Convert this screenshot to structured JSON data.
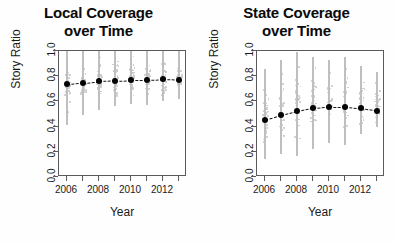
{
  "figure": {
    "panel_count": 2,
    "background": "#ffffff"
  },
  "panels": [
    {
      "id": "local",
      "title_line1": "Local Coverage",
      "title_line2": "over Time",
      "xlabel": "Year",
      "ylabel": "Story Ratio"
    },
    {
      "id": "state",
      "title_line1": "State Coverage",
      "title_line2": "over Time",
      "xlabel": "Year",
      "ylabel": "Story Ratio"
    }
  ],
  "axis": {
    "y_ticks": [
      "0.0",
      "0.2",
      "0.4",
      "0.6",
      "0.8",
      "1.0"
    ],
    "y_tick_values": [
      0.0,
      0.2,
      0.4,
      0.6,
      0.8,
      1.0
    ],
    "x_tick_values": [
      2006,
      2007,
      2008,
      2009,
      2010,
      2011,
      2012,
      2013
    ],
    "x_tick_labels": [
      "2006",
      "",
      "2008",
      "",
      "2010",
      "",
      "2012",
      ""
    ],
    "x_labeled": [
      "2006",
      "2008",
      "2010",
      "2012"
    ]
  },
  "colors": {
    "mean_point": "#050505",
    "trend_line": "#151515",
    "error_bar": "#bfbfbf",
    "scatter": "#c9c9c9",
    "axis": "#5a5a5a",
    "text": "#1a1a1a"
  },
  "chart_data": [
    {
      "type": "scatter",
      "id": "local",
      "title": "Local Coverage over Time",
      "xlabel": "Year",
      "ylabel": "Story Ratio",
      "xlim": [
        2005.5,
        2013.5
      ],
      "ylim": [
        0.0,
        1.0
      ],
      "grid": false,
      "legend": "none",
      "x": [
        2006,
        2007,
        2008,
        2009,
        2010,
        2011,
        2012,
        2013
      ],
      "series": [
        {
          "name": "Mean Story Ratio",
          "values": [
            0.74,
            0.75,
            0.76,
            0.765,
            0.77,
            0.77,
            0.775,
            0.77
          ],
          "marker": "filled-circle",
          "line": "dashed"
        }
      ],
      "error_bars": [
        {
          "x": 2006,
          "low": 0.41,
          "high": 1.0
        },
        {
          "x": 2007,
          "low": 0.49,
          "high": 1.0
        },
        {
          "x": 2008,
          "low": 0.53,
          "high": 1.0
        },
        {
          "x": 2009,
          "low": 0.56,
          "high": 1.0
        },
        {
          "x": 2010,
          "low": 0.58,
          "high": 1.0
        },
        {
          "x": 2011,
          "low": 0.57,
          "high": 1.0
        },
        {
          "x": 2012,
          "low": 0.6,
          "high": 1.0
        },
        {
          "x": 2013,
          "low": 0.62,
          "high": 1.0
        }
      ],
      "scatter_cloud_note": "light grey jittered individual observations in vertical strips at each year, densest near 0.6-1.0"
    },
    {
      "type": "scatter",
      "id": "state",
      "title": "State Coverage over Time",
      "xlabel": "Year",
      "ylabel": "Story Ratio",
      "xlim": [
        2005.5,
        2013.5
      ],
      "ylim": [
        0.0,
        1.0
      ],
      "grid": false,
      "legend": "none",
      "x": [
        2006,
        2007,
        2008,
        2009,
        2010,
        2011,
        2012,
        2013
      ],
      "series": [
        {
          "name": "Mean Story Ratio",
          "values": [
            0.45,
            0.49,
            0.52,
            0.545,
            0.555,
            0.555,
            0.545,
            0.525
          ],
          "marker": "filled-circle",
          "line": "dashed"
        }
      ],
      "error_bars": [
        {
          "x": 2006,
          "low": 0.14,
          "high": 0.86
        },
        {
          "x": 2007,
          "low": 0.18,
          "high": 0.93
        },
        {
          "x": 2008,
          "low": 0.17,
          "high": 0.99
        },
        {
          "x": 2009,
          "low": 0.22,
          "high": 0.95
        },
        {
          "x": 2010,
          "low": 0.27,
          "high": 0.93
        },
        {
          "x": 2011,
          "low": 0.25,
          "high": 0.95
        },
        {
          "x": 2012,
          "low": 0.34,
          "high": 0.88
        },
        {
          "x": 2013,
          "low": 0.4,
          "high": 0.83
        }
      ],
      "scatter_cloud_note": "light grey jittered individual observations in vertical strips at each year, spread broadly 0.1-1.0"
    }
  ]
}
